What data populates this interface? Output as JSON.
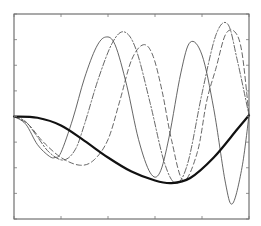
{
  "chart_data": {
    "type": "line",
    "title": "",
    "xlabel": "",
    "ylabel": "",
    "xlim": [
      0,
      1
    ],
    "ylim": [
      -4,
      4
    ],
    "grid": false,
    "legend": null,
    "x_ticks": [
      0,
      0.2,
      0.4,
      0.6,
      0.8,
      1.0
    ],
    "y_ticks": [
      -4,
      -3,
      -2,
      -1,
      0,
      1,
      2,
      3,
      4
    ],
    "tick_labels_visible": false,
    "series": [
      {
        "name": "thick-solid",
        "style": "solid",
        "width": 2.2,
        "x": [
          0,
          0.1,
          0.2,
          0.3,
          0.4,
          0.5,
          0.6,
          0.67,
          0.75,
          0.85,
          0.95,
          1.0
        ],
        "y": [
          0,
          -0.05,
          -0.35,
          -0.95,
          -1.6,
          -2.15,
          -2.5,
          -2.6,
          -2.4,
          -1.6,
          -0.5,
          0.05
        ]
      },
      {
        "name": "thin-solid",
        "style": "solid",
        "width": 0.9,
        "x": [
          0,
          0.05,
          0.1,
          0.15,
          0.175,
          0.2,
          0.25,
          0.3,
          0.35,
          0.39,
          0.43,
          0.48,
          0.53,
          0.58,
          0.62,
          0.66,
          0.71,
          0.75,
          0.8,
          0.85,
          0.9,
          0.93,
          0.97,
          1.0
        ],
        "y": [
          0,
          -0.3,
          -1.1,
          -1.55,
          -1.6,
          -1.4,
          -0.1,
          1.5,
          2.7,
          3.1,
          2.8,
          1.2,
          -0.9,
          -2.2,
          -2.2,
          -0.8,
          1.7,
          2.9,
          2.4,
          0.3,
          -2.6,
          -3.4,
          -2.0,
          0.05
        ]
      },
      {
        "name": "dash-dot",
        "style": "dashdot",
        "width": 0.9,
        "x": [
          0,
          0.05,
          0.1,
          0.15,
          0.21,
          0.26,
          0.3,
          0.36,
          0.42,
          0.47,
          0.52,
          0.58,
          0.64,
          0.69,
          0.74,
          0.8,
          0.86,
          0.91,
          0.95,
          1.0
        ],
        "y": [
          0,
          -0.2,
          -0.8,
          -1.4,
          -1.7,
          -1.3,
          -0.3,
          1.5,
          2.9,
          3.3,
          2.6,
          0.5,
          -1.8,
          -2.6,
          -1.8,
          0.9,
          3.2,
          3.6,
          2.2,
          0.05
        ]
      },
      {
        "name": "dashed",
        "style": "dashed",
        "width": 0.9,
        "x": [
          0,
          0.06,
          0.12,
          0.2,
          0.28,
          0.34,
          0.4,
          0.45,
          0.5,
          0.55,
          0.59,
          0.63,
          0.67,
          0.72,
          0.78,
          0.82,
          0.86,
          0.9,
          0.94,
          0.97,
          1.0
        ],
        "y": [
          0,
          -0.3,
          -0.95,
          -1.6,
          -1.9,
          -1.7,
          -0.9,
          0.6,
          2.2,
          2.8,
          2.4,
          1.0,
          -0.9,
          -2.5,
          -1.4,
          0.6,
          1.9,
          3.2,
          3.3,
          2.5,
          0.05
        ]
      }
    ]
  }
}
